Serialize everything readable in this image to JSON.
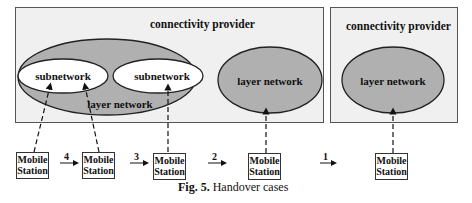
{
  "figure": {
    "caption_label": "Fig. 5.",
    "caption_text": " Handover cases",
    "providers": [
      {
        "title": "connectivity provider",
        "layer_network": "layer network",
        "subnetworks": [
          "subnetwork",
          "subnetwork"
        ],
        "second_layer_network": "layer network"
      },
      {
        "title": "connectivity provider",
        "layer_network": "layer network"
      }
    ],
    "mobile_stations": [
      {
        "line1": "Mobile",
        "line2": "Station"
      },
      {
        "line1": "Mobile",
        "line2": "Station"
      },
      {
        "line1": "Mobile",
        "line2": "Station"
      },
      {
        "line1": "Mobile",
        "line2": "Station"
      },
      {
        "line1": "Mobile",
        "line2": "Station"
      }
    ],
    "steps": [
      "4",
      "3",
      "2",
      "1"
    ],
    "colors": {
      "box_fill": "#f0f0f0",
      "ellipse_fill": "#b0b0b0",
      "inner_fill": "#ffffff"
    }
  }
}
